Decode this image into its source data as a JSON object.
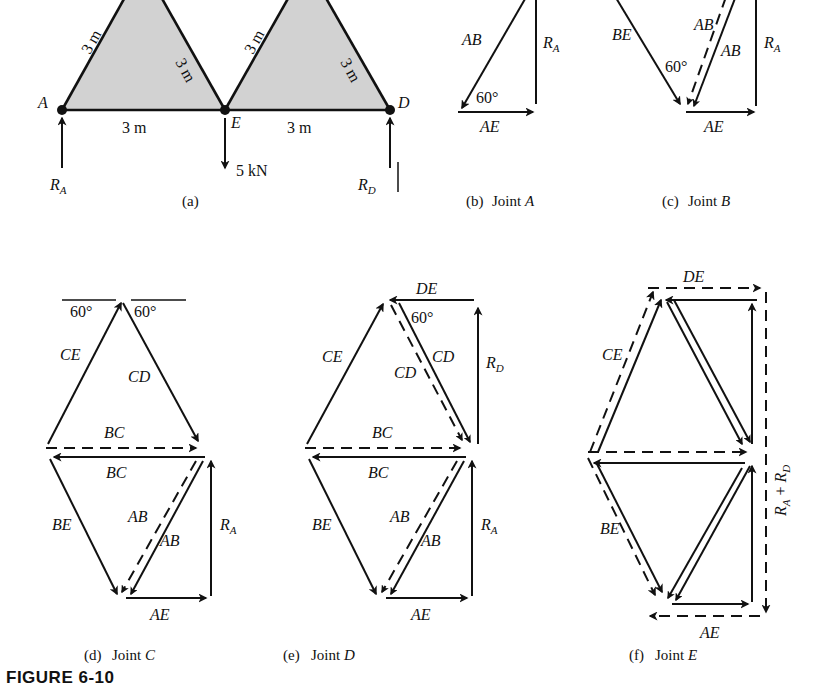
{
  "figure": {
    "caption": "FIGURE 6-10"
  },
  "panels": [
    {
      "id": "a",
      "caption": "(a)",
      "title": ""
    },
    {
      "id": "b",
      "caption": "(b)",
      "title": "Joint A"
    },
    {
      "id": "c",
      "caption": "(c)",
      "title": "Joint B"
    },
    {
      "id": "d",
      "caption": "(d)",
      "title": "Joint C"
    },
    {
      "id": "e",
      "caption": "(e)",
      "title": "Joint D"
    },
    {
      "id": "f",
      "caption": "(f)",
      "title": "Joint E"
    }
  ],
  "truss": {
    "joints": [
      "A",
      "E",
      "D"
    ],
    "member_lengths": [
      "3 m",
      "3 m",
      "3 m",
      "3 m",
      "3 m",
      "3 m"
    ],
    "top_chord_lengths": [
      "3 m",
      "3 m",
      "3 m",
      "3 m"
    ],
    "bottom_span_left": "3 m",
    "bottom_span_right": "3 m",
    "reactions": {
      "left": "RA",
      "right": "RD"
    },
    "load": "5 kN",
    "angle": "60°"
  },
  "joint_a": {
    "labels": {
      "ab": "AB",
      "ra": "RA",
      "ae": "AE",
      "angle": "60°"
    }
  },
  "joint_b": {
    "labels": {
      "be": "BE",
      "ab1": "AB",
      "ab2": "AB",
      "ra": "RA",
      "ae": "AE",
      "angle": "60°"
    }
  },
  "joint_c": {
    "labels": {
      "ce": "CE",
      "cd": "CD",
      "bc_upper": "BC",
      "bc_lower": "BC",
      "be": "BE",
      "ab1": "AB",
      "ab2": "AB",
      "ra": "RA",
      "ae": "AE",
      "angle_left": "60°",
      "angle_right": "60°"
    }
  },
  "joint_d": {
    "labels": {
      "de": "DE",
      "ce": "CE",
      "cd1": "CD",
      "cd2": "CD",
      "rd": "RD",
      "bc_upper": "BC",
      "bc_lower": "BC",
      "be": "BE",
      "ab1": "AB",
      "ab2": "AB",
      "ra": "RA",
      "ae": "AE",
      "angle": "60°"
    }
  },
  "joint_e": {
    "labels": {
      "de": "DE",
      "ce": "CE",
      "be": "BE",
      "ae": "AE",
      "ra_rd": "RA + RD"
    }
  },
  "colors": {
    "ink": "#111111",
    "shade": "#d2d2d2",
    "paper": "#ffffff"
  }
}
